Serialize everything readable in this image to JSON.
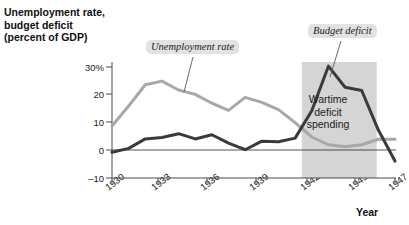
{
  "chart_data": {
    "type": "line",
    "title": "",
    "ylabel_lines": [
      "Unemployment rate,",
      "budget deficit",
      "(percent of GDP)"
    ],
    "xlabel": "Year",
    "xlim": [
      1930,
      1947
    ],
    "ylim": [
      -10,
      33
    ],
    "yticks": [
      "30%",
      "20",
      "10",
      "0",
      "–10"
    ],
    "ytick_values": [
      30,
      20,
      10,
      0,
      -10
    ],
    "xticks": [
      "1930",
      "1933",
      "1936",
      "1939",
      "1942",
      "1945",
      "1947"
    ],
    "xtick_values": [
      1930,
      1933,
      1936,
      1939,
      1942,
      1945,
      1947
    ],
    "grid": false,
    "legend": "none",
    "x": [
      1930,
      1931,
      1932,
      1933,
      1934,
      1935,
      1936,
      1937,
      1938,
      1939,
      1940,
      1941,
      1942,
      1943,
      1944,
      1945,
      1946,
      1947
    ],
    "series": [
      {
        "name": "Unemployment rate",
        "color": "#a8a8a8",
        "values": [
          8.7,
          15.9,
          23.6,
          24.9,
          21.7,
          20.1,
          16.9,
          14.3,
          19.0,
          17.2,
          14.6,
          9.9,
          4.7,
          1.9,
          1.2,
          1.9,
          3.9,
          3.9
        ]
      },
      {
        "name": "Budget deficit",
        "color": "#3a3a3a",
        "values": [
          -0.8,
          0.6,
          4.0,
          4.5,
          5.9,
          4.0,
          5.5,
          2.5,
          0.1,
          3.2,
          3.0,
          4.3,
          14.2,
          30.3,
          22.7,
          21.5,
          7.2,
          -4.0
        ]
      }
    ],
    "shaded_region": {
      "label_lines": [
        "Wartime",
        "deficit",
        "spending"
      ],
      "x_start": 1941.4,
      "x_end": 1945.9,
      "color": "#d5d5d5"
    },
    "callouts": [
      {
        "name": "unemployment-rate-callout",
        "text": "Unemployment rate"
      },
      {
        "name": "budget-deficit-callout",
        "text": "Budget deficit"
      }
    ]
  }
}
